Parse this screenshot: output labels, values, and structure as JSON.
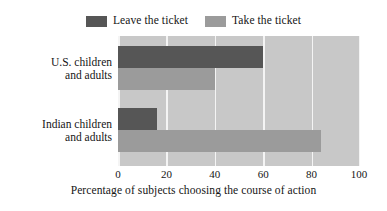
{
  "chart_data": {
    "type": "bar",
    "orientation": "horizontal",
    "title": "",
    "xlabel": "Percentage of subjects choosing the course of action",
    "ylabel": "",
    "categories": [
      "U.S. children\nand adults",
      "Indian children\nand adults"
    ],
    "series": [
      {
        "name": "Leave the ticket",
        "values": [
          60,
          16
        ],
        "color": "#565656"
      },
      {
        "name": "Take the ticket",
        "values": [
          40,
          84
        ],
        "color": "#9b9b9b"
      }
    ],
    "xlim": [
      0,
      100
    ],
    "xticks": [
      0,
      20,
      40,
      60,
      80,
      100
    ],
    "xtick_labels": [
      "0",
      "20",
      "40",
      "60",
      "80",
      "100"
    ],
    "grid": "vertical-white",
    "legend_position": "top-center",
    "plot_background": "#c8c8c8"
  },
  "legend": {
    "entries": [
      {
        "label": "Leave the ticket",
        "swatch": "legend-swatch-leave"
      },
      {
        "label": "Take the ticket",
        "swatch": "legend-swatch-take"
      }
    ]
  },
  "axis": {
    "x_title": "Percentage of subjects choosing the course of action",
    "tick_0": "0",
    "tick_20": "20",
    "tick_40": "40",
    "tick_60": "60",
    "tick_80": "80",
    "tick_100": "100"
  },
  "categories": {
    "us": "U.S. children\nand adults",
    "india": "Indian children\nand adults"
  }
}
